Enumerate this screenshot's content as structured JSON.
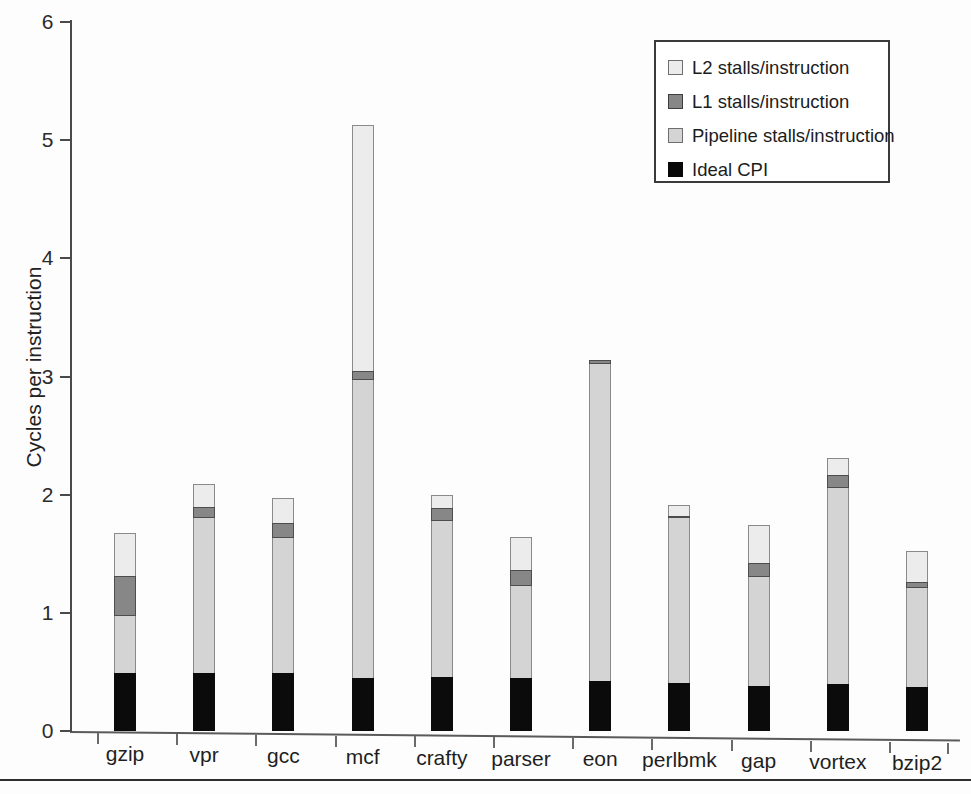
{
  "chart_data": {
    "type": "bar",
    "subtype": "stacked-bar",
    "title": "",
    "xlabel": "",
    "ylabel": "Cycles per instruction",
    "ylim": [
      0,
      6
    ],
    "yticks": [
      0,
      1,
      2,
      3,
      4,
      5,
      6
    ],
    "ytick_labels": [
      "0",
      "1",
      "2",
      "3",
      "4",
      "5",
      "6"
    ],
    "grid": false,
    "legend_position": "top-right",
    "categories": [
      "gzip",
      "vpr",
      "gcc",
      "mcf",
      "crafty",
      "parser",
      "eon",
      "perlbmk",
      "gap",
      "vortex",
      "bzip2"
    ],
    "series": [
      {
        "name": "Ideal CPI",
        "color": "#0b0b0b",
        "values": [
          0.49,
          0.49,
          0.49,
          0.45,
          0.46,
          0.45,
          0.42,
          0.41,
          0.38,
          0.4,
          0.37
        ]
      },
      {
        "name": "Pipeline stalls/instruction",
        "color": "#d4d4d4",
        "values": [
          0.48,
          1.31,
          1.14,
          2.52,
          1.32,
          0.78,
          2.69,
          1.39,
          0.92,
          1.66,
          0.84
        ]
      },
      {
        "name": "L1 stalls/instruction",
        "color": "#878787",
        "values": [
          0.34,
          0.1,
          0.13,
          0.08,
          0.11,
          0.13,
          0.03,
          0.02,
          0.12,
          0.11,
          0.05
        ]
      },
      {
        "name": "L2 stalls/instruction",
        "color": "#ececec",
        "values": [
          0.37,
          0.19,
          0.21,
          2.08,
          0.11,
          0.28,
          0.0,
          0.09,
          0.32,
          0.14,
          0.26
        ]
      }
    ],
    "totals": [
      1.68,
      2.09,
      1.97,
      5.13,
      2.0,
      1.64,
      3.14,
      1.91,
      1.74,
      2.31,
      1.52
    ]
  },
  "legend": {
    "items": [
      {
        "label": "L2 stalls/instruction",
        "swatch": "l2"
      },
      {
        "label": "L1 stalls/instruction",
        "swatch": "l1"
      },
      {
        "label": "Pipeline stalls/instruction",
        "swatch": "pipe"
      },
      {
        "label": "Ideal CPI",
        "swatch": "ideal"
      }
    ]
  }
}
